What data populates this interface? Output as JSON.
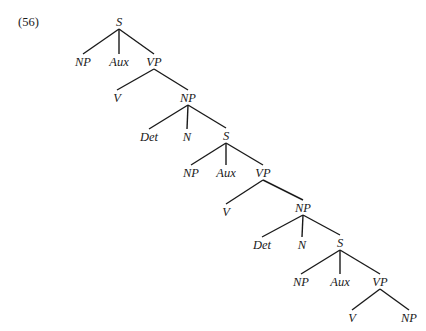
{
  "example_number": "(56)",
  "tree": {
    "nodes": [
      {
        "id": "s1",
        "label": "S",
        "x": 119,
        "y": 22
      },
      {
        "id": "np1",
        "label": "NP",
        "x": 83,
        "y": 62
      },
      {
        "id": "aux1",
        "label": "Aux",
        "x": 119,
        "y": 62
      },
      {
        "id": "vp1",
        "label": "VP",
        "x": 154,
        "y": 62
      },
      {
        "id": "v1",
        "label": "V",
        "x": 117,
        "y": 98
      },
      {
        "id": "np2",
        "label": "NP",
        "x": 188,
        "y": 98
      },
      {
        "id": "det1",
        "label": "Det",
        "x": 149,
        "y": 137
      },
      {
        "id": "n1",
        "label": "N",
        "x": 187,
        "y": 137
      },
      {
        "id": "s2",
        "label": "S",
        "x": 226,
        "y": 136
      },
      {
        "id": "np3",
        "label": "NP",
        "x": 191,
        "y": 173
      },
      {
        "id": "aux2",
        "label": "Aux",
        "x": 226,
        "y": 173
      },
      {
        "id": "vp2",
        "label": "VP",
        "x": 263,
        "y": 173
      },
      {
        "id": "v2",
        "label": "V",
        "x": 226,
        "y": 212
      },
      {
        "id": "np4",
        "label": "NP",
        "x": 303,
        "y": 208
      },
      {
        "id": "det2",
        "label": "Det",
        "x": 262,
        "y": 245
      },
      {
        "id": "n2",
        "label": "N",
        "x": 302,
        "y": 245
      },
      {
        "id": "s3",
        "label": "S",
        "x": 340,
        "y": 243
      },
      {
        "id": "np5",
        "label": "NP",
        "x": 301,
        "y": 282
      },
      {
        "id": "aux3",
        "label": "Aux",
        "x": 340,
        "y": 282
      },
      {
        "id": "vp3",
        "label": "VP",
        "x": 380,
        "y": 282
      },
      {
        "id": "v3",
        "label": "V",
        "x": 352,
        "y": 318
      },
      {
        "id": "np6",
        "label": "NP",
        "x": 409,
        "y": 318
      }
    ],
    "edges": [
      [
        "s1",
        "np1"
      ],
      [
        "s1",
        "aux1"
      ],
      [
        "s1",
        "vp1"
      ],
      [
        "vp1",
        "v1"
      ],
      [
        "vp1",
        "np2"
      ],
      [
        "np2",
        "det1"
      ],
      [
        "np2",
        "n1"
      ],
      [
        "np2",
        "s2"
      ],
      [
        "s2",
        "np3"
      ],
      [
        "s2",
        "aux2"
      ],
      [
        "s2",
        "vp2"
      ],
      [
        "vp2",
        "v2"
      ],
      [
        "vp2",
        "np4"
      ],
      [
        "np4",
        "det2"
      ],
      [
        "np4",
        "n2"
      ],
      [
        "np4",
        "s3"
      ],
      [
        "s3",
        "np5"
      ],
      [
        "s3",
        "aux3"
      ],
      [
        "s3",
        "vp3"
      ],
      [
        "vp3",
        "v3"
      ],
      [
        "vp3",
        "np6"
      ]
    ]
  }
}
